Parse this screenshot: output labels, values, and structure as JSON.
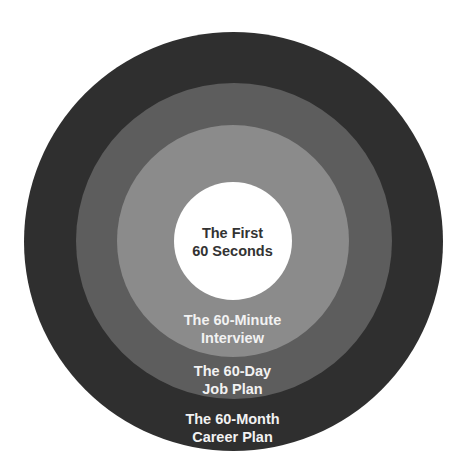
{
  "diagram": {
    "type": "concentric-circles",
    "colors": {
      "ring_outer": "#2f2f2f",
      "ring_second": "#5d5d5d",
      "ring_third": "#8b8b8b",
      "center": "#ffffff",
      "label_on_dark": "#f2f2f2",
      "label_center": "#333333"
    },
    "layers": [
      {
        "name": "center",
        "line1": "The First",
        "line2": "60 Seconds"
      },
      {
        "name": "third",
        "line1": "The 60-Minute",
        "line2": "Interview"
      },
      {
        "name": "second",
        "line1": "The 60-Day",
        "line2": "Job Plan"
      },
      {
        "name": "outer",
        "line1": "The 60-Month",
        "line2": "Career Plan"
      }
    ]
  }
}
